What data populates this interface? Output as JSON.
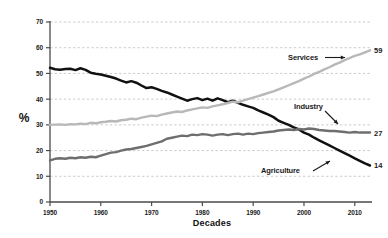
{
  "chart_data": {
    "type": "line",
    "title": "",
    "xlabel": "Decades",
    "ylabel": "%",
    "xlim": [
      1950,
      2013
    ],
    "ylim": [
      0,
      70
    ],
    "grid": true,
    "legend_position": "inline-annotations",
    "xticks": [
      "1950",
      "1960",
      "1970",
      "1980",
      "1990",
      "2000",
      "2010"
    ],
    "xtick_values": [
      1950,
      1960,
      1970,
      1980,
      1990,
      2000,
      2010
    ],
    "yticks": [
      "0",
      "10",
      "20",
      "30",
      "40",
      "50",
      "60",
      "70"
    ],
    "ytick_values": [
      0,
      10,
      20,
      30,
      40,
      50,
      60,
      70
    ],
    "series": [
      {
        "name": "Agriculture",
        "color": "#111111",
        "end_label": "14",
        "end_value": 14,
        "start_value": 52,
        "annotation_label": "Agriculture",
        "x": [
          1950,
          1951,
          1952,
          1953,
          1954,
          1955,
          1956,
          1957,
          1958,
          1959,
          1960,
          1961,
          1962,
          1963,
          1964,
          1965,
          1966,
          1967,
          1968,
          1969,
          1970,
          1971,
          1972,
          1973,
          1974,
          1975,
          1976,
          1977,
          1978,
          1979,
          1980,
          1981,
          1982,
          1983,
          1984,
          1985,
          1986,
          1987,
          1988,
          1989,
          1990,
          1991,
          1992,
          1993,
          1994,
          1995,
          1996,
          1997,
          1998,
          1999,
          2000,
          2001,
          2002,
          2003,
          2004,
          2005,
          2006,
          2007,
          2008,
          2009,
          2010,
          2011,
          2012,
          2013
        ],
        "values": [
          52.2,
          51.6,
          51.4,
          51.7,
          51.8,
          51.3,
          52.0,
          51.4,
          50.3,
          49.9,
          49.6,
          49.1,
          48.6,
          48.0,
          47.2,
          46.5,
          47.0,
          46.4,
          45.3,
          44.3,
          44.6,
          44.0,
          43.2,
          42.6,
          41.8,
          41.0,
          40.2,
          39.4,
          40.0,
          40.4,
          39.6,
          40.2,
          39.4,
          40.3,
          39.6,
          38.8,
          39.4,
          38.6,
          37.8,
          37.2,
          36.6,
          35.6,
          34.8,
          34.0,
          33.0,
          31.6,
          30.8,
          30.0,
          29.0,
          28.2,
          27.0,
          26.2,
          25.0,
          24.0,
          23.0,
          22.0,
          21.0,
          20.0,
          19.0,
          18.0,
          17.0,
          16.0,
          15.0,
          14.2
        ]
      },
      {
        "name": "Services",
        "color": "#b8b8b8",
        "end_label": "59",
        "end_value": 59,
        "start_value": 30,
        "annotation_label": "Services",
        "x": [
          1950,
          1951,
          1952,
          1953,
          1954,
          1955,
          1956,
          1957,
          1958,
          1959,
          1960,
          1961,
          1962,
          1963,
          1964,
          1965,
          1966,
          1967,
          1968,
          1969,
          1970,
          1971,
          1972,
          1973,
          1974,
          1975,
          1976,
          1977,
          1978,
          1979,
          1980,
          1981,
          1982,
          1983,
          1984,
          1985,
          1986,
          1987,
          1988,
          1989,
          1990,
          1991,
          1992,
          1993,
          1994,
          1995,
          1996,
          1997,
          1998,
          1999,
          2000,
          2001,
          2002,
          2003,
          2004,
          2005,
          2006,
          2007,
          2008,
          2009,
          2010,
          2011,
          2012,
          2013
        ],
        "values": [
          30.0,
          30.1,
          30.2,
          30.0,
          30.3,
          30.2,
          30.5,
          30.3,
          30.8,
          30.6,
          31.0,
          31.2,
          31.5,
          31.3,
          31.8,
          32.0,
          32.4,
          32.2,
          32.8,
          33.2,
          33.6,
          33.4,
          34.0,
          34.4,
          34.8,
          35.2,
          35.0,
          35.6,
          36.0,
          36.4,
          36.8,
          36.6,
          37.2,
          37.6,
          38.0,
          38.5,
          39.0,
          38.8,
          39.4,
          40.0,
          40.6,
          41.2,
          41.8,
          42.4,
          43.0,
          43.8,
          44.6,
          45.4,
          46.2,
          47.0,
          48.0,
          48.8,
          49.8,
          50.6,
          51.6,
          52.4,
          53.4,
          54.2,
          55.2,
          56.0,
          56.8,
          57.4,
          58.2,
          59.0
        ]
      },
      {
        "name": "Industry",
        "color": "#6e6e6e",
        "end_label": "27",
        "end_value": 27,
        "start_value": 16,
        "annotation_label": "Industry",
        "x": [
          1950,
          1951,
          1952,
          1953,
          1954,
          1955,
          1956,
          1957,
          1958,
          1959,
          1960,
          1961,
          1962,
          1963,
          1964,
          1965,
          1966,
          1967,
          1968,
          1969,
          1970,
          1971,
          1972,
          1973,
          1974,
          1975,
          1976,
          1977,
          1978,
          1979,
          1980,
          1981,
          1982,
          1983,
          1984,
          1985,
          1986,
          1987,
          1988,
          1989,
          1990,
          1991,
          1992,
          1993,
          1994,
          1995,
          1996,
          1997,
          1998,
          1999,
          2000,
          2001,
          2002,
          2003,
          2004,
          2005,
          2006,
          2007,
          2008,
          2009,
          2010,
          2011,
          2012,
          2013
        ],
        "values": [
          16.2,
          16.8,
          17.0,
          16.8,
          17.2,
          17.0,
          17.4,
          17.2,
          17.6,
          17.4,
          18.0,
          18.6,
          19.2,
          19.4,
          20.0,
          20.4,
          20.6,
          21.0,
          21.4,
          21.8,
          22.4,
          23.0,
          23.6,
          24.6,
          25.0,
          25.4,
          25.8,
          25.6,
          26.2,
          26.0,
          26.4,
          26.2,
          25.8,
          26.2,
          26.4,
          26.0,
          26.4,
          26.6,
          26.2,
          26.6,
          26.4,
          26.8,
          27.0,
          27.2,
          27.4,
          27.8,
          28.0,
          28.2,
          28.0,
          28.4,
          28.2,
          28.6,
          28.4,
          28.0,
          27.8,
          27.6,
          27.6,
          27.4,
          27.2,
          27.0,
          27.2,
          27.0,
          27.0,
          27.0
        ]
      }
    ]
  }
}
